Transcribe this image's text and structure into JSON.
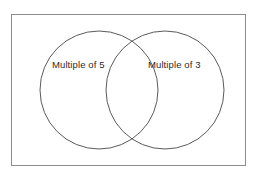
{
  "diagram": {
    "type": "venn",
    "title": "",
    "background_color": "#ffffff",
    "border_color": "#8d8d8d",
    "circle_stroke_color": "#5a5a5a",
    "text_color": "#2b2b2b",
    "universe": {
      "name": "universal-set-rectangle",
      "fill": "#ffffff"
    },
    "sets": [
      {
        "id": "left",
        "label": "Multiple of 5",
        "cx": 99,
        "cy": 90,
        "r": 59,
        "fill": "none"
      },
      {
        "id": "right",
        "label": "Multiple of 3",
        "cx": 165,
        "cy": 90,
        "r": 59,
        "fill": "none"
      }
    ],
    "intersection": {
      "label": "",
      "shaded": false
    }
  }
}
